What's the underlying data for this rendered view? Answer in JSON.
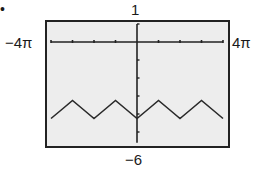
{
  "chart_data": {
    "type": "line",
    "title": "",
    "bullet": "•",
    "xlabel": "",
    "ylabel": "",
    "window": {
      "xmin_label": "−4π",
      "xmax_label": "4π",
      "ymin_label": "−6",
      "ymax_label": "1",
      "xlim": [
        -12.566,
        12.566
      ],
      "ylim": [
        -6,
        1
      ],
      "xscl": "π",
      "yscl": 1
    },
    "grid": false,
    "legend": null,
    "period": "2π",
    "series": [
      {
        "name": "graph",
        "x_in_pi": [
          -4,
          -3.5,
          -3,
          -2.5,
          -2,
          -1.5,
          -1,
          -0.5,
          0,
          0.5,
          1,
          1.5,
          2,
          2.5,
          3,
          3.5,
          4
        ],
        "y": [
          -4.25,
          -3.75,
          -3.25,
          -3.75,
          -4.25,
          -3.75,
          -3.25,
          -3.75,
          -4.25,
          -3.75,
          -3.25,
          -3.75,
          -4.25,
          -3.75,
          -3.25,
          -3.75,
          -4.25
        ]
      }
    ],
    "annotations": {
      "peaks_y": -3.25,
      "troughs_y": -4.25
    }
  },
  "colors": {
    "screen_bg": "#ededed",
    "frame": "#222222",
    "curve": "#2a2a2a"
  }
}
